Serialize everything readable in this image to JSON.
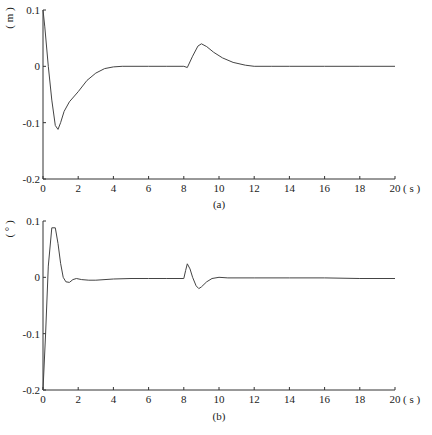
{
  "chart_data": [
    {
      "type": "line",
      "panel": "a",
      "caption": "(a)",
      "ylabel": "( m )",
      "xlabel": "( s )",
      "xlim": [
        0,
        20
      ],
      "ylim": [
        -0.2,
        0.1
      ],
      "xticks": [
        0,
        2,
        4,
        6,
        8,
        10,
        12,
        14,
        16,
        18,
        20
      ],
      "xtick_labels": [
        "0",
        "2",
        "4",
        "6",
        "8",
        "10",
        "12",
        "14",
        "16",
        "18",
        "20"
      ],
      "yticks": [
        0.1,
        0,
        -0.1,
        -0.2
      ],
      "ytick_labels": [
        "0.1",
        "0",
        "-0.1",
        "-0.2"
      ],
      "grid": false,
      "series": [
        {
          "name": "displacement",
          "x": [
            0,
            0.1,
            0.3,
            0.5,
            0.7,
            0.85,
            1.0,
            1.2,
            1.5,
            2.0,
            2.5,
            3.0,
            3.5,
            4.0,
            4.5,
            5.0,
            6.0,
            7.0,
            8.0,
            8.2,
            8.5,
            8.8,
            9.0,
            9.3,
            9.7,
            10.2,
            10.8,
            11.5,
            12.0,
            13.0,
            14.0,
            16.0,
            18.0,
            20.0
          ],
          "y": [
            0.1,
            0.07,
            0.0,
            -0.06,
            -0.105,
            -0.112,
            -0.1,
            -0.08,
            -0.063,
            -0.045,
            -0.025,
            -0.012,
            -0.004,
            -0.001,
            0.0,
            0.0,
            0.0,
            0.0,
            0.0,
            -0.002,
            0.018,
            0.036,
            0.04,
            0.035,
            0.025,
            0.015,
            0.007,
            0.002,
            0.0,
            0.0,
            0.0,
            0.0,
            0.0,
            0.0
          ]
        }
      ]
    },
    {
      "type": "line",
      "panel": "b",
      "caption": "(b)",
      "ylabel": "( ° )",
      "xlabel": "( s )",
      "xlim": [
        0,
        20
      ],
      "ylim": [
        -0.2,
        0.1
      ],
      "xticks": [
        0,
        2,
        4,
        6,
        8,
        10,
        12,
        14,
        16,
        18,
        20
      ],
      "xtick_labels": [
        "0",
        "2",
        "4",
        "6",
        "8",
        "10",
        "12",
        "14",
        "16",
        "18",
        "20"
      ],
      "yticks": [
        0.1,
        0,
        -0.1,
        -0.2
      ],
      "ytick_labels": [
        "0.1",
        "0",
        "-0.1",
        "-0.2"
      ],
      "grid": false,
      "series": [
        {
          "name": "angle",
          "x": [
            0,
            0.15,
            0.3,
            0.5,
            0.7,
            0.85,
            1.0,
            1.15,
            1.3,
            1.5,
            1.7,
            1.9,
            2.2,
            2.6,
            3.0,
            4.0,
            5.0,
            6.0,
            7.0,
            8.0,
            8.1,
            8.2,
            8.35,
            8.5,
            8.7,
            8.85,
            9.0,
            9.3,
            9.6,
            10.0,
            10.5,
            12.0,
            14.0,
            16.0,
            18.0,
            20.0
          ],
          "y": [
            -0.2,
            -0.1,
            0.02,
            0.088,
            0.088,
            0.06,
            0.025,
            0.0,
            -0.008,
            -0.009,
            -0.004,
            -0.002,
            -0.004,
            -0.005,
            -0.005,
            -0.003,
            -0.002,
            -0.002,
            -0.002,
            -0.002,
            0.012,
            0.024,
            0.015,
            0.0,
            -0.015,
            -0.02,
            -0.017,
            -0.008,
            -0.002,
            0.0,
            -0.001,
            -0.001,
            -0.001,
            -0.001,
            -0.002,
            -0.002
          ]
        }
      ]
    }
  ],
  "layout": {
    "panels": [
      {
        "left": 43,
        "right": 395,
        "top": 10,
        "bottom": 179,
        "caption_y": 208
      },
      {
        "left": 43,
        "right": 395,
        "top": 221,
        "bottom": 390,
        "caption_y": 420
      }
    ]
  }
}
